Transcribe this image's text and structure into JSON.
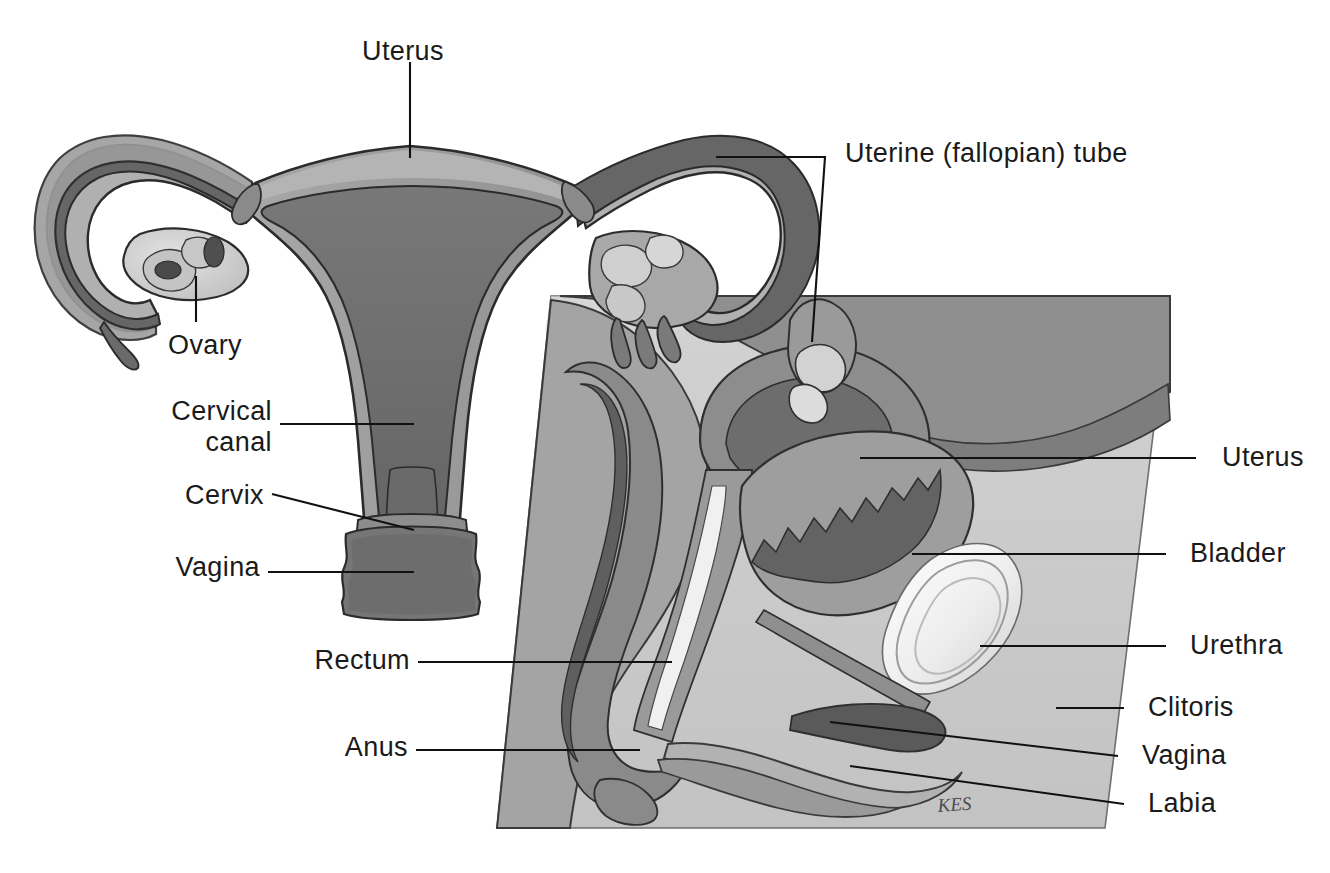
{
  "figure": {
    "signature": "KES",
    "background_color": "#ffffff",
    "label_color": "#1a1a1a",
    "leader_color": "#111111",
    "palette": {
      "outline": "#2b2b2b",
      "myometrium": "#9c9c9c",
      "endometrium": "#6e6e6e",
      "serosa": "#8a8a8a",
      "tube_light": "#b3b3b3",
      "tube_dark": "#5f5f5f",
      "ovary_light": "#d8d8d8",
      "follicle": "#4a4a4a",
      "panel": "#c9c9c9",
      "panel_top": "#d7d7d7",
      "tissue_mid": "#a9a9a9",
      "tissue_dark": "#6a6a6a",
      "tissue_darker": "#565656",
      "bone_white": "#f2f2f2",
      "highlight": "#e8e8e8"
    }
  },
  "views": [
    {
      "name": "anterior-view",
      "description": "Anterior (frontal) view of uterus, uterine tubes, ovaries, cervix and vagina"
    },
    {
      "name": "sagittal-view",
      "description": "Midsagittal section of the female pelvis"
    }
  ],
  "labels": [
    {
      "id": "uterus-top",
      "text": "Uterus",
      "side": "top",
      "x": 362,
      "y": 36,
      "leader": "vertical"
    },
    {
      "id": "uterine-tube",
      "text": "Uterine (fallopian) tube",
      "side": "right",
      "x": 845,
      "y": 138,
      "leader": "bracket"
    },
    {
      "id": "ovary",
      "text": "Ovary",
      "side": "left",
      "x": 168,
      "y": 330,
      "leader": "vertical"
    },
    {
      "id": "cervical-canal",
      "text": "Cervical\ncanal",
      "side": "left",
      "x": 152,
      "y": 396,
      "leader": "horizontal"
    },
    {
      "id": "cervix",
      "text": "Cervix",
      "side": "left",
      "x": 184,
      "y": 480,
      "leader": "angled"
    },
    {
      "id": "vagina-left",
      "text": "Vagina",
      "side": "left",
      "x": 172,
      "y": 552,
      "leader": "horizontal"
    },
    {
      "id": "rectum",
      "text": "Rectum",
      "side": "left",
      "x": 318,
      "y": 645,
      "leader": "horizontal"
    },
    {
      "id": "anus",
      "text": "Anus",
      "side": "left",
      "x": 348,
      "y": 732,
      "leader": "horizontal"
    },
    {
      "id": "uterus-right",
      "text": "Uterus",
      "side": "right",
      "x": 1222,
      "y": 442,
      "leader": "horizontal"
    },
    {
      "id": "bladder",
      "text": "Bladder",
      "side": "right",
      "x": 1190,
      "y": 538,
      "leader": "horizontal"
    },
    {
      "id": "urethra",
      "text": "Urethra",
      "side": "right",
      "x": 1190,
      "y": 630,
      "leader": "horizontal"
    },
    {
      "id": "clitoris",
      "text": "Clitoris",
      "side": "right",
      "x": 1148,
      "y": 692,
      "leader": "horizontal"
    },
    {
      "id": "vagina-right",
      "text": "Vagina",
      "side": "right",
      "x": 1142,
      "y": 740,
      "leader": "horizontal"
    },
    {
      "id": "labia",
      "text": "Labia",
      "side": "right",
      "x": 1148,
      "y": 788,
      "leader": "horizontal"
    }
  ],
  "structures": [
    "uterus",
    "uterine tube",
    "ovary",
    "fimbriae",
    "cervical canal",
    "cervix",
    "vagina",
    "rectum",
    "anus",
    "bladder",
    "urethra",
    "clitoris",
    "labia",
    "pubic bone"
  ]
}
